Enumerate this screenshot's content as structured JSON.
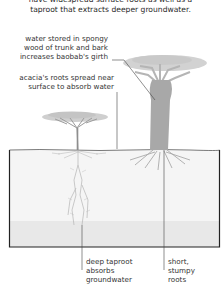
{
  "intro": {
    "line1": "have widespread surface roots as well as a",
    "line2": "taproot that extracts deeper groundwater."
  },
  "labels": {
    "baobab_water": [
      "water stored in spongy",
      "wood of trunk and bark",
      "increases baobab's girth"
    ],
    "acacia_roots": [
      "acacia's roots spread near",
      "surface to absorb water"
    ],
    "taproot": [
      "deep taproot",
      "absorbs",
      "groundwater"
    ],
    "stumpy": [
      "short,",
      "stumpy",
      "roots"
    ]
  },
  "trees": [
    "acacia",
    "baobab"
  ],
  "colors": {
    "foliage": "#c9c9c9",
    "trunk": "#a9a9a9",
    "ground": "#f4f4f4",
    "groundwater": "#e6e6e6",
    "outline": "#222222",
    "roots": "#b0b0b0"
  }
}
